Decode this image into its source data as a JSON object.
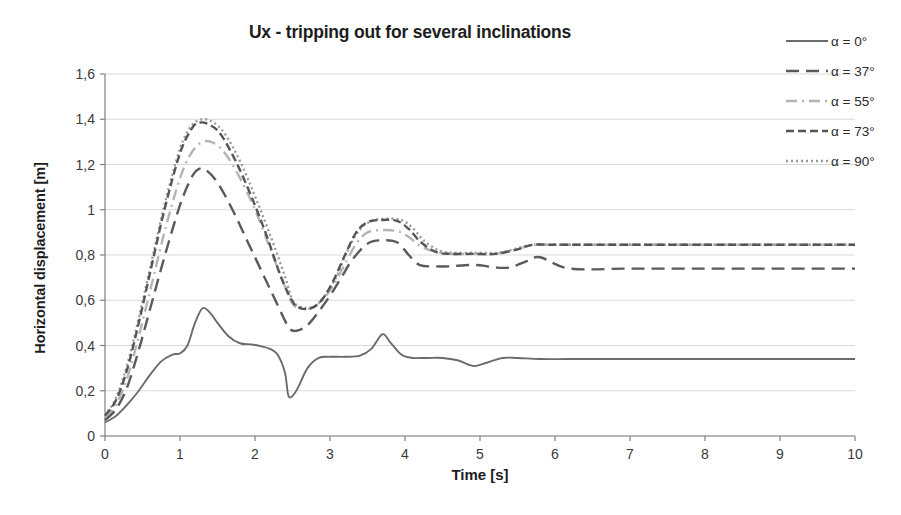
{
  "chart_data": {
    "type": "line",
    "title": "Ux - tripping out for several inclinations",
    "xlabel": "Time [s]",
    "ylabel": "Horizontal displacement [m]",
    "xlim": [
      0,
      10
    ],
    "ylim": [
      0,
      1.6
    ],
    "xticks": [
      "0",
      "1",
      "2",
      "3",
      "4",
      "5",
      "6",
      "7",
      "8",
      "9",
      "10"
    ],
    "yticks": [
      "0",
      "0,2",
      "0,4",
      "0,6",
      "0,8",
      "1",
      "1,2",
      "1,4",
      "1,6"
    ],
    "grid": "horizontal",
    "legend_position": "right",
    "decimal_separator": ",",
    "series": [
      {
        "name": "α = 0°",
        "style": "solid",
        "color": "#6b6b6b",
        "x": [
          0,
          0.15,
          0.3,
          0.45,
          0.6,
          0.75,
          0.9,
          1.0,
          1.1,
          1.2,
          1.3,
          1.4,
          1.5,
          1.65,
          1.8,
          1.95,
          2.1,
          2.2,
          2.3,
          2.4,
          2.45,
          2.55,
          2.7,
          2.85,
          3.0,
          3.2,
          3.4,
          3.55,
          3.7,
          3.8,
          3.95,
          4.1,
          4.3,
          4.5,
          4.7,
          4.85,
          4.95,
          5.1,
          5.3,
          5.5,
          5.8,
          6.2,
          7.0,
          8.0,
          9.0,
          10.0
        ],
        "y": [
          0.06,
          0.09,
          0.14,
          0.2,
          0.27,
          0.33,
          0.36,
          0.365,
          0.4,
          0.5,
          0.565,
          0.545,
          0.5,
          0.44,
          0.41,
          0.405,
          0.395,
          0.385,
          0.36,
          0.28,
          0.175,
          0.2,
          0.3,
          0.345,
          0.35,
          0.35,
          0.355,
          0.385,
          0.45,
          0.415,
          0.36,
          0.345,
          0.345,
          0.345,
          0.335,
          0.315,
          0.31,
          0.325,
          0.345,
          0.345,
          0.34,
          0.34,
          0.34,
          0.34,
          0.34,
          0.34
        ]
      },
      {
        "name": "α = 37°",
        "style": "longdash",
        "color": "#5a5a5a",
        "x": [
          0,
          0.15,
          0.3,
          0.45,
          0.6,
          0.8,
          1.0,
          1.15,
          1.25,
          1.35,
          1.5,
          1.7,
          1.9,
          2.1,
          2.3,
          2.45,
          2.55,
          2.7,
          2.85,
          3.0,
          3.15,
          3.3,
          3.5,
          3.7,
          3.9,
          4.05,
          4.2,
          4.4,
          4.6,
          4.8,
          5.0,
          5.2,
          5.4,
          5.6,
          5.8,
          6.2,
          7.0,
          8.0,
          9.0,
          10.0
        ],
        "y": [
          0.07,
          0.12,
          0.22,
          0.38,
          0.56,
          0.8,
          1.02,
          1.14,
          1.18,
          1.175,
          1.12,
          1.0,
          0.86,
          0.72,
          0.58,
          0.48,
          0.465,
          0.49,
          0.55,
          0.62,
          0.7,
          0.78,
          0.85,
          0.865,
          0.855,
          0.8,
          0.755,
          0.75,
          0.75,
          0.755,
          0.755,
          0.745,
          0.745,
          0.77,
          0.79,
          0.74,
          0.74,
          0.74,
          0.74,
          0.74
        ]
      },
      {
        "name": "α = 55°",
        "style": "dashdot",
        "color": "#b4b4b4",
        "x": [
          0,
          0.15,
          0.3,
          0.45,
          0.6,
          0.8,
          1.0,
          1.15,
          1.3,
          1.45,
          1.6,
          1.8,
          2.0,
          2.2,
          2.4,
          2.5,
          2.6,
          2.75,
          2.9,
          3.05,
          3.2,
          3.35,
          3.5,
          3.7,
          3.9,
          4.05,
          4.2,
          4.4,
          4.6,
          4.9,
          5.2,
          5.5,
          5.7,
          6.0,
          6.5,
          7.5,
          8.5,
          10.0
        ],
        "y": [
          0.08,
          0.14,
          0.26,
          0.44,
          0.64,
          0.91,
          1.14,
          1.25,
          1.3,
          1.295,
          1.25,
          1.14,
          1.0,
          0.83,
          0.66,
          0.585,
          0.565,
          0.565,
          0.6,
          0.67,
          0.76,
          0.85,
          0.9,
          0.91,
          0.905,
          0.88,
          0.84,
          0.815,
          0.805,
          0.805,
          0.805,
          0.825,
          0.845,
          0.845,
          0.845,
          0.845,
          0.845,
          0.845
        ]
      },
      {
        "name": "α = 73°",
        "style": "dash",
        "color": "#555555",
        "x": [
          0,
          0.15,
          0.3,
          0.45,
          0.6,
          0.8,
          1.0,
          1.15,
          1.25,
          1.4,
          1.55,
          1.75,
          1.95,
          2.15,
          2.35,
          2.5,
          2.6,
          2.75,
          2.9,
          3.05,
          3.2,
          3.35,
          3.5,
          3.7,
          3.9,
          4.05,
          4.2,
          4.4,
          4.6,
          4.9,
          5.2,
          5.5,
          5.7,
          6.0,
          6.5,
          7.5,
          8.5,
          10.0
        ],
        "y": [
          0.09,
          0.16,
          0.3,
          0.5,
          0.72,
          1.01,
          1.25,
          1.355,
          1.385,
          1.375,
          1.33,
          1.21,
          1.06,
          0.89,
          0.7,
          0.595,
          0.565,
          0.565,
          0.605,
          0.69,
          0.8,
          0.9,
          0.945,
          0.955,
          0.95,
          0.915,
          0.86,
          0.815,
          0.805,
          0.805,
          0.805,
          0.825,
          0.845,
          0.845,
          0.845,
          0.845,
          0.845,
          0.845
        ]
      },
      {
        "name": "α = 90°",
        "style": "dotted",
        "color": "#9a9a9a",
        "x": [
          0,
          0.15,
          0.3,
          0.45,
          0.6,
          0.8,
          1.0,
          1.15,
          1.3,
          1.45,
          1.6,
          1.8,
          2.0,
          2.2,
          2.4,
          2.5,
          2.62,
          2.78,
          2.92,
          3.08,
          3.22,
          3.38,
          3.55,
          3.75,
          3.95,
          4.1,
          4.25,
          4.45,
          4.65,
          4.95,
          5.25,
          5.5,
          5.7,
          6.0,
          6.5,
          7.5,
          8.5,
          10.0
        ],
        "y": [
          0.09,
          0.17,
          0.32,
          0.52,
          0.74,
          1.03,
          1.27,
          1.37,
          1.4,
          1.385,
          1.335,
          1.215,
          1.06,
          0.89,
          0.705,
          0.6,
          0.57,
          0.57,
          0.615,
          0.7,
          0.81,
          0.905,
          0.95,
          0.96,
          0.955,
          0.92,
          0.865,
          0.82,
          0.81,
          0.81,
          0.81,
          0.83,
          0.845,
          0.845,
          0.845,
          0.845,
          0.845,
          0.845
        ]
      }
    ]
  },
  "legend": {
    "items": [
      {
        "label": "α = 0°",
        "swatch": "legend-line-solid"
      },
      {
        "label": "α = 37°",
        "swatch": "legend-line-longdash"
      },
      {
        "label": "α = 55°",
        "swatch": "legend-line-dashdot"
      },
      {
        "label": "α = 73°",
        "swatch": "legend-line-dash"
      },
      {
        "label": "α = 90°",
        "swatch": "legend-line-dotted"
      }
    ]
  },
  "colors": {
    "axis": "#808080",
    "grid": "#d9d9d9",
    "text": "#3a3a3a",
    "title": "#1d1d1d"
  }
}
